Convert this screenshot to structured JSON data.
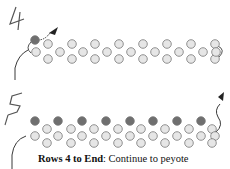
{
  "steps": [
    {
      "label": "4",
      "label_pos": [
        10,
        6
      ]
    },
    {
      "label": "5",
      "label_pos": [
        10,
        92
      ]
    }
  ],
  "colors": {
    "bead_fill": "#e6e6e6",
    "bead_stroke": "#777777",
    "dark_bead": "#6f6f6f",
    "thread": "#222222"
  },
  "caption": {
    "bold": "Rows 4 to End",
    "text": ": Continue to peyote"
  }
}
